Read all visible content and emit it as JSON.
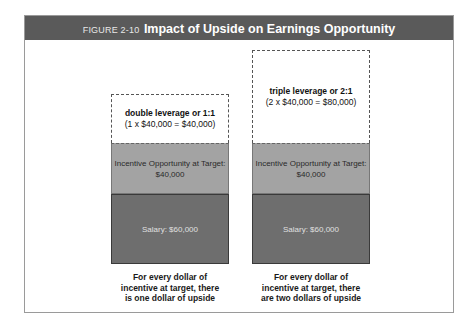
{
  "header": {
    "figure_label": "FIGURE 2-10",
    "title": "Impact of Upside on Earnings Opportunity"
  },
  "columns": [
    {
      "upside_line1": "double leverage or 1:1",
      "upside_line2": "(1 x $40,000 = $40,000)",
      "incentive_line1": "Incentive Opportunity at Target:",
      "incentive_line2": "$40,000",
      "salary": "Salary: $60,000",
      "caption_line1": "For every dollar of",
      "caption_line2": "incentive at target, there",
      "caption_line3": "is one dollar of upside"
    },
    {
      "upside_line1": "triple leverage or 2:1",
      "upside_line2": "(2 x $40,000 = $80,000)",
      "incentive_line1": "Incentive Opportunity at Target:",
      "incentive_line2": "$40,000",
      "salary": "Salary: $60,000",
      "caption_line1": "For every dollar of",
      "caption_line2": "incentive at target, there",
      "caption_line3": "are two dollars of upside"
    }
  ],
  "colors": {
    "header_bg": "#5a5a5a",
    "incentive_fill": "#a3a3a3",
    "salary_fill": "#6e6e6e"
  }
}
